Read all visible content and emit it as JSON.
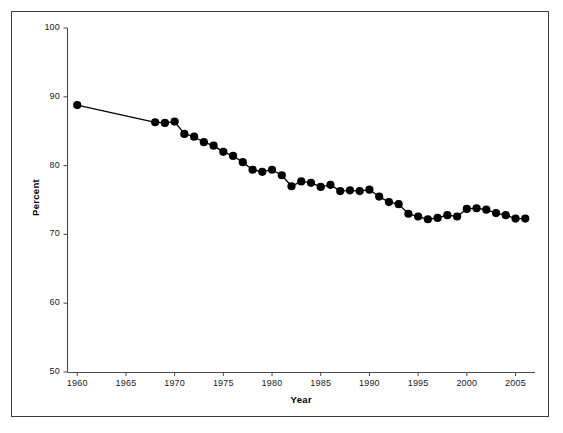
{
  "chart_data": {
    "type": "line",
    "title": "",
    "subtitle": "",
    "xlabel": "Year",
    "ylabel": "Percent",
    "xlim": [
      1959,
      2007
    ],
    "ylim": [
      50,
      100
    ],
    "xticks": [
      1960,
      1965,
      1970,
      1975,
      1980,
      1985,
      1990,
      1995,
      2000,
      2005
    ],
    "yticks": [
      50,
      60,
      70,
      80,
      90,
      100
    ],
    "grid": false,
    "legend": null,
    "marker": "filled-circle",
    "marker_color": "#000000",
    "line_color": "#000000",
    "series": [
      {
        "name": "Percent",
        "x": [
          1960,
          1968,
          1969,
          1970,
          1971,
          1972,
          1973,
          1974,
          1975,
          1976,
          1977,
          1978,
          1979,
          1980,
          1981,
          1982,
          1983,
          1984,
          1985,
          1986,
          1987,
          1988,
          1989,
          1990,
          1991,
          1992,
          1993,
          1994,
          1995,
          1996,
          1997,
          1998,
          1999,
          2000,
          2001,
          2002,
          2003,
          2004,
          2005,
          2006
        ],
        "values": [
          88.8,
          86.3,
          86.2,
          86.4,
          84.6,
          84.2,
          83.4,
          82.9,
          82.0,
          81.4,
          80.5,
          79.4,
          79.1,
          79.4,
          78.6,
          77.0,
          77.7,
          77.5,
          76.9,
          77.2,
          76.3,
          76.4,
          76.3,
          76.5,
          75.5,
          74.7,
          74.4,
          73.0,
          72.6,
          72.2,
          72.4,
          72.8,
          72.6,
          73.7,
          73.8,
          73.6,
          73.1,
          72.8,
          72.3,
          72.3
        ]
      }
    ]
  },
  "axis": {
    "ylabel_text": "Percent",
    "xlabel_text": "Year",
    "ytick_texts": [
      "50",
      "60",
      "70",
      "80",
      "90",
      "100"
    ],
    "xtick_texts": [
      "1960",
      "1965",
      "1970",
      "1975",
      "1980",
      "1985",
      "1990",
      "1995",
      "2000",
      "2005"
    ]
  }
}
